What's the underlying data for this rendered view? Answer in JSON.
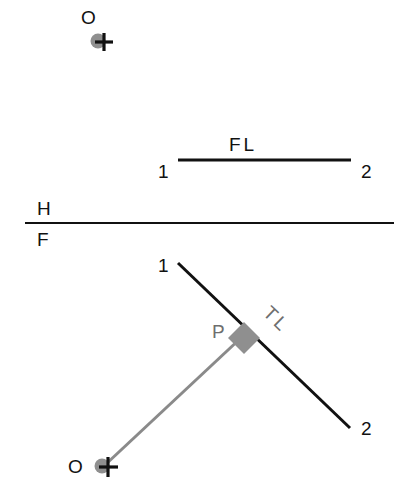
{
  "diagram": {
    "colors": {
      "ink": "#111111",
      "grey_line": "#8a8a8a",
      "grey_fill": "#8f8f8f",
      "grey_label": "#6e6e6e",
      "background": "#ffffff"
    },
    "fold_line": {
      "upper_label": "H",
      "lower_label": "F"
    },
    "top_view": {
      "point_label": "O",
      "line_label": "FL",
      "endpoint_1": "1",
      "endpoint_2": "2"
    },
    "front_view": {
      "point_label": "O",
      "line_label": "TL",
      "perpendicular_foot_label": "P",
      "endpoint_1": "1",
      "endpoint_2": "2"
    }
  }
}
